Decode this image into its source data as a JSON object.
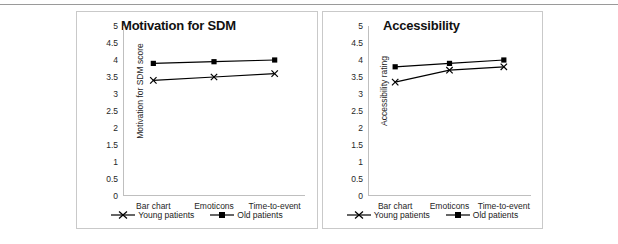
{
  "figure": {
    "background": "#ffffff",
    "rule_color": "#9a9a9a",
    "frame_color": "#c9c9c9",
    "series_color": "#000000"
  },
  "legend": {
    "young_label": "Young patients",
    "old_label": "Old patients",
    "young_marker": "x-marker",
    "old_marker": "square-marker"
  },
  "chart_data": [
    {
      "type": "line",
      "title": "Motivation for SDM",
      "xlabel": "",
      "ylabel": "Motivation for SDM score",
      "categories": [
        "Bar chart",
        "Emoticons",
        "Time-to-event"
      ],
      "ylim": [
        0,
        5
      ],
      "yticks": [
        "0",
        "0.5",
        "1",
        "1.5",
        "2",
        "2.5",
        "3",
        "3.5",
        "4",
        "4.5",
        "5"
      ],
      "ytick_values": [
        0,
        0.5,
        1,
        1.5,
        2,
        2.5,
        3,
        3.5,
        4,
        4.5,
        5
      ],
      "grid": false,
      "legend_position": "bottom",
      "series": [
        {
          "name": "Young patients",
          "marker": "x",
          "values": [
            3.4,
            3.5,
            3.6
          ]
        },
        {
          "name": "Old patients",
          "marker": "square",
          "values": [
            3.9,
            3.95,
            4.0
          ]
        }
      ]
    },
    {
      "type": "line",
      "title": "Accessibility",
      "xlabel": "",
      "ylabel": "Accessibility rating",
      "categories": [
        "Bar chart",
        "Emoticons",
        "Time-to-event"
      ],
      "ylim": [
        0,
        5
      ],
      "yticks": [
        "0",
        "0.5",
        "1",
        "1.5",
        "2",
        "2.5",
        "3",
        "3.5",
        "4",
        "4.5",
        "5"
      ],
      "ytick_values": [
        0,
        0.5,
        1,
        1.5,
        2,
        2.5,
        3,
        3.5,
        4,
        4.5,
        5
      ],
      "grid": false,
      "legend_position": "bottom",
      "series": [
        {
          "name": "Young patients",
          "marker": "x",
          "values": [
            3.35,
            3.7,
            3.8
          ]
        },
        {
          "name": "Old patients",
          "marker": "square",
          "values": [
            3.8,
            3.9,
            4.0
          ]
        }
      ]
    }
  ]
}
